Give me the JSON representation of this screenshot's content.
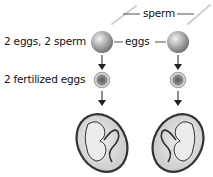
{
  "labels": {
    "sperm": "sperm",
    "eggs": "eggs",
    "row1": "2 eggs, 2 sperm",
    "row2": "2 fertilized eggs"
  },
  "colors": {
    "egg": "#8a8a8a",
    "fertilized_core": "#6e6e6e",
    "embryo_fill": "#d6d6d6",
    "outline": "#333333",
    "sperm_streak": "#cfcfcf"
  }
}
